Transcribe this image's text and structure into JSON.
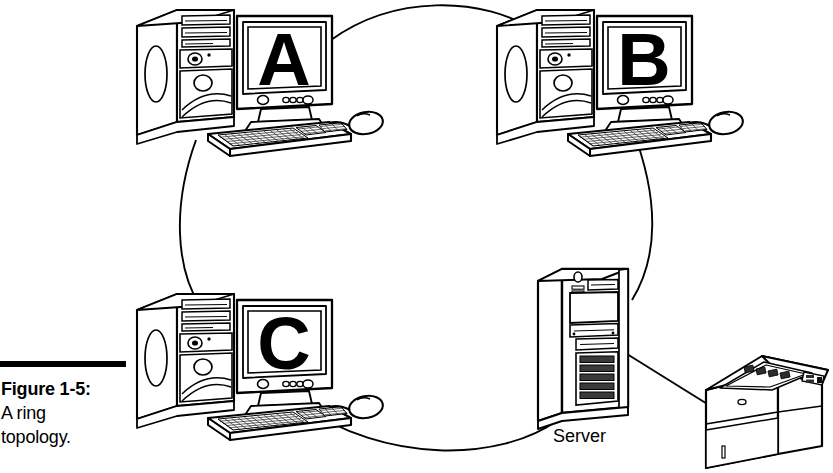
{
  "figure": {
    "caption_title": "Figure 1-5:",
    "caption_line1": "A ring",
    "caption_line2": "topology.",
    "rule_color": "#000000",
    "background_color": "#ffffff",
    "line_color": "#000000",
    "width": 833,
    "height": 473
  },
  "diagram": {
    "type": "network-topology",
    "topology": "ring",
    "nodes": [
      {
        "id": "A",
        "label": "A",
        "kind": "desktop-computer",
        "position": "top-left",
        "x": 240,
        "y": 60
      },
      {
        "id": "B",
        "label": "B",
        "kind": "desktop-computer",
        "position": "top-right",
        "x": 600,
        "y": 60
      },
      {
        "id": "C",
        "label": "C",
        "kind": "desktop-computer",
        "position": "bottom-left",
        "x": 240,
        "y": 345
      },
      {
        "id": "SERVER",
        "label": "Server",
        "kind": "server-tower",
        "position": "bottom-right",
        "x": 590,
        "y": 345
      },
      {
        "id": "PRINTER",
        "label": "",
        "kind": "laser-printer",
        "position": "far-bottom-right",
        "x": 760,
        "y": 415
      }
    ],
    "links": [
      {
        "from": "A",
        "to": "B",
        "shape": "arc",
        "side": "top"
      },
      {
        "from": "B",
        "to": "SERVER",
        "shape": "arc",
        "side": "right"
      },
      {
        "from": "SERVER",
        "to": "C",
        "shape": "arc",
        "side": "bottom"
      },
      {
        "from": "C",
        "to": "A",
        "shape": "arc",
        "side": "left"
      },
      {
        "from": "SERVER",
        "to": "PRINTER",
        "shape": "straight",
        "side": "spur"
      }
    ]
  },
  "icons": {
    "computer": "desktop-computer-icon",
    "server": "server-tower-icon",
    "printer": "laser-printer-icon",
    "keyboard": "keyboard-icon",
    "mouse": "mouse-icon",
    "monitor": "monitor-icon"
  }
}
